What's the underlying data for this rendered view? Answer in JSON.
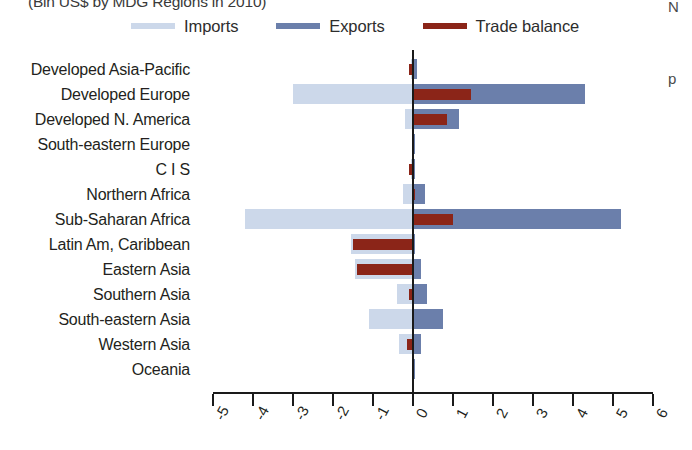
{
  "chart_data": {
    "type": "bar",
    "orientation": "horizontal",
    "title": "(Bln US$ by MDG Regions in 2010)",
    "xlabel": "",
    "ylabel": "",
    "xlim": [
      -5,
      6
    ],
    "xticks": [
      -5,
      -4,
      -3,
      -2,
      -1,
      0,
      1,
      2,
      3,
      4,
      5,
      6
    ],
    "xtick_labels": [
      "-5",
      "-4",
      "-3",
      "-2",
      "-1",
      "0",
      "1",
      "2",
      "3",
      "4",
      "5",
      "6"
    ],
    "grid": false,
    "legend_position": "top",
    "zero_reference_line": true,
    "categories": [
      "Developed Asia-Pacific",
      "Developed Europe",
      "Developed N. America",
      "South-eastern Europe",
      "C I S",
      "Northern Africa",
      "Sub-Saharan Africa",
      "Latin Am, Caribbean",
      "Eastern Asia",
      "Southern Asia",
      "South-eastern Asia",
      "Western Asia",
      "Oceania"
    ],
    "series": [
      {
        "name": "Imports",
        "color": "#ccd8ea",
        "values": [
          -0.05,
          -3.0,
          -0.2,
          -0.02,
          -0.05,
          -0.25,
          -4.2,
          -1.55,
          -1.45,
          -0.4,
          -1.1,
          -0.35,
          -0.02
        ]
      },
      {
        "name": "Exports",
        "color": "#6b7fab",
        "values": [
          0.1,
          4.3,
          1.15,
          0.03,
          0.02,
          0.3,
          5.2,
          0.05,
          0.2,
          0.35,
          0.75,
          0.2,
          0.02
        ]
      },
      {
        "name": "Trade balance",
        "color": "#8b2518",
        "values": [
          -0.1,
          1.45,
          0.85,
          0.0,
          -0.1,
          0.05,
          1.0,
          -1.5,
          -1.4,
          -0.1,
          0.0,
          -0.15,
          0.0
        ]
      }
    ]
  },
  "legend": {
    "items": [
      {
        "label": "Imports",
        "color": "#ccd8ea"
      },
      {
        "label": "Exports",
        "color": "#6b7fab"
      },
      {
        "label": "Trade balance",
        "color": "#8b2518"
      }
    ]
  },
  "margin_text": {
    "fragment_top": "N",
    "fragment_mid": "p"
  }
}
